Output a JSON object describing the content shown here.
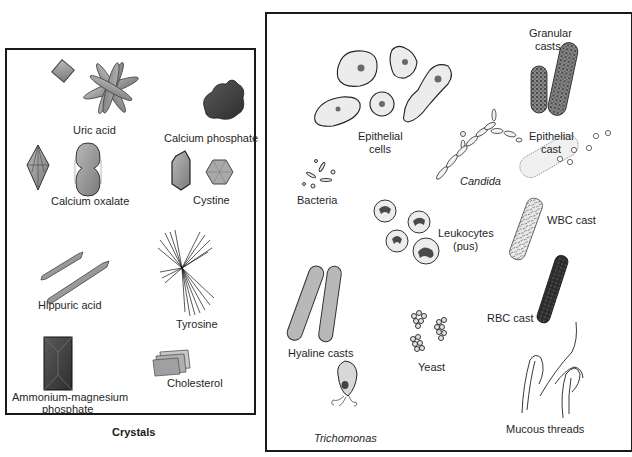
{
  "figure": {
    "crystals_panel": {
      "caption": "Crystals",
      "labels": {
        "uric_acid": "Uric acid",
        "calcium_phosphate": "Calcium phosphate",
        "calcium_oxalate": "Calcium oxalate",
        "cystine": "Cystine",
        "hippuric_acid": "Hippuric acid",
        "tyrosine": "Tyrosine",
        "ammonium_magnesium_phosphate_line1": "Ammonium-magnesium",
        "ammonium_magnesium_phosphate_line2": "phosphate",
        "cholesterol": "Cholesterol"
      }
    },
    "sediment_panel": {
      "labels": {
        "epithelial_cells_line1": "Epithelial",
        "epithelial_cells_line2": "cells",
        "granular_casts_line1": "Granular",
        "granular_casts_line2": "casts",
        "candida": "Candida",
        "epithelial_cast_line1": "Epithelial",
        "epithelial_cast_line2": "cast",
        "bacteria": "Bacteria",
        "leukocytes_line1": "Leukocytes",
        "leukocytes_line2": "(pus)",
        "wbc_cast": "WBC cast",
        "hyaline_casts": "Hyaline casts",
        "yeast": "Yeast",
        "rbc_cast": "RBC cast",
        "trichomonas": "Trichomonas",
        "mucous_threads": "Mucous threads"
      }
    },
    "colors": {
      "border": "#1a1a1a",
      "crystal_fill": "#9a9a9a",
      "crystal_dark": "#3c3c3c",
      "cell_fill": "#ececec",
      "nucleus": "#6a6a6a",
      "rbc_cast": "#2a2a2a"
    }
  }
}
